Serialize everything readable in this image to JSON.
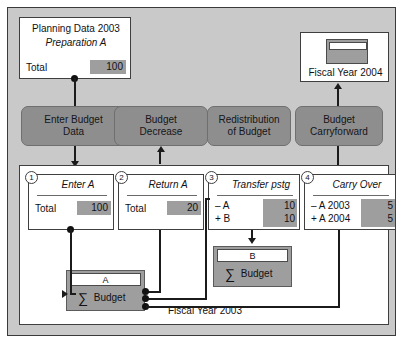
{
  "diagram": {
    "title_top_card": {
      "heading": "Planning Data 2003",
      "subheading": "Preparation A",
      "row_label": "Total",
      "row_value": "100"
    },
    "fiscal_year_2004_card": {
      "label": "Fiscal Year 2004"
    },
    "process_buttons": [
      {
        "label": "Enter Budget\nData"
      },
      {
        "label": "Budget\nDecrease"
      },
      {
        "label": "Redistribution\nof Budget"
      },
      {
        "label": "Budget\nCarryforward"
      }
    ],
    "fiscal_year_2003_label": "Fiscal Year 2003",
    "steps": [
      {
        "number": "1",
        "title": "Enter A",
        "rows": [
          {
            "label": "Total",
            "value": "100"
          }
        ]
      },
      {
        "number": "2",
        "title": "Return A",
        "rows": [
          {
            "label": "Total",
            "value": "20"
          }
        ]
      },
      {
        "number": "3",
        "title": "Transfer pstg",
        "rows": [
          {
            "label": "– A",
            "value": "10"
          },
          {
            "label": "+ B",
            "value": "10"
          }
        ]
      },
      {
        "number": "4",
        "title": "Carry Over",
        "rows": [
          {
            "label": "– A 2003",
            "value": "5"
          },
          {
            "label": "+ A 2004",
            "value": "5"
          }
        ]
      }
    ],
    "sum_objects": [
      {
        "cap": "A",
        "label": "Budget",
        "sigma": "∑"
      },
      {
        "cap": "B",
        "label": "Budget",
        "sigma": "∑"
      }
    ],
    "colors": {
      "canvas_gray": "#c9c9c9",
      "button_gray": "#8e8e8e",
      "chip_gray": "#9e9e9e",
      "line_black": "#1b1b1b",
      "card_white": "#ffffff"
    }
  }
}
